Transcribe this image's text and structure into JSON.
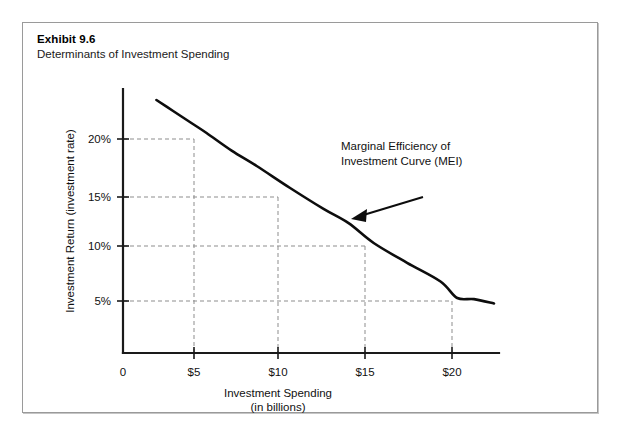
{
  "exhibit": {
    "number": "Exhibit 9.6",
    "subtitle": "Determinants of Investment Spending"
  },
  "colors": {
    "curve": "#0d0d0d",
    "axis": "#1a1a1a",
    "guide": "#8d8d8d",
    "frame_border": "#9a9a9a",
    "background": "#ffffff"
  },
  "chart_data": {
    "type": "line",
    "title": "Determinants of Investment Spending",
    "xlabel": "Investment Spending",
    "xlabel_sub": "(in billions)",
    "ylabel": "Investment Return (investment rate)",
    "xlim": [
      0,
      22.5
    ],
    "ylim": [
      0,
      24
    ],
    "grid": false,
    "legend": "none",
    "x_tick_labels": [
      "0",
      "$5",
      "$10",
      "$15",
      "$20"
    ],
    "x_tick_values": [
      0,
      5,
      10,
      15,
      20
    ],
    "y_tick_labels": [
      "20%",
      "15%",
      "10%",
      "5%"
    ],
    "y_tick_values": [
      20,
      15,
      10,
      5
    ],
    "series": [
      {
        "name": "Marginal Efficiency of Investment Curve (MEI)",
        "x": [
          2,
          3,
          4,
          5,
          6.5,
          8,
          10,
          12,
          13.5,
          15,
          17,
          19,
          20,
          21,
          22.2
        ],
        "y": [
          23,
          22,
          21,
          20,
          18.4,
          17,
          15,
          13.1,
          11.8,
          10,
          8.2,
          6.5,
          5,
          4.9,
          4.5
        ]
      }
    ],
    "data_points": [
      {
        "x": 5,
        "y": 20,
        "label": "$5 / 20%"
      },
      {
        "x": 10,
        "y": 15,
        "label": "$10 / 15%"
      },
      {
        "x": 15,
        "y": 10,
        "label": "$15 / 10%"
      },
      {
        "x": 20,
        "y": 5,
        "label": "$20 / 5%"
      }
    ],
    "annotations": [
      {
        "text_line_1": "Marginal Efficiency of",
        "text_line_2": "Investment Curve (MEI)",
        "arrow_from": [
          17.2,
          12.6
        ],
        "arrow_to": [
          13.6,
          11.5
        ]
      }
    ]
  }
}
